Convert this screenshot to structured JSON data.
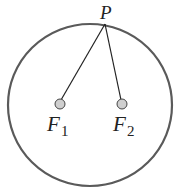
{
  "diagram": {
    "title": "",
    "ellipse": {
      "cx": 90,
      "cy": 105,
      "rx": 82,
      "ry": 81,
      "stroke": "#5a5a5a",
      "stroke_width": 2.2
    },
    "point_P": {
      "label": "P",
      "x": 105,
      "y": 23
    },
    "foci": [
      {
        "label": "F",
        "subscript": "1",
        "x": 60,
        "y": 104,
        "fill": "#cfcfcf"
      },
      {
        "label": "F",
        "subscript": "2",
        "x": 122,
        "y": 104,
        "fill": "#cfcfcf"
      }
    ],
    "segments": [
      {
        "from": "P",
        "to": "F1"
      },
      {
        "from": "P",
        "to": "F2"
      }
    ]
  }
}
